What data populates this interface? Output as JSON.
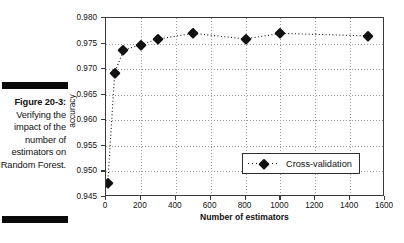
{
  "caption": {
    "label": "Figure 20-3:",
    "body": "Verifying the impact of the number of estimators on Random Forest."
  },
  "chart_data": {
    "type": "line",
    "title": "",
    "xlabel": "Number of estimators",
    "ylabel": "accuracy",
    "xlim": [
      0,
      1600
    ],
    "ylim": [
      0.945,
      0.98
    ],
    "xticks": [
      0,
      200,
      400,
      600,
      800,
      1000,
      1200,
      1400,
      1600
    ],
    "xtick_labels": [
      "0",
      "200",
      "400",
      "600",
      "800",
      "1000",
      "1200",
      "1400",
      "1600"
    ],
    "yticks": [
      0.945,
      0.95,
      0.955,
      0.96,
      0.965,
      0.97,
      0.975,
      0.98
    ],
    "ytick_labels": [
      "0.945",
      "0.950",
      "0.955",
      "0.960",
      "0.965",
      "0.970",
      "0.975",
      "0.980"
    ],
    "grid": true,
    "legend_position": "lower right",
    "series": [
      {
        "name": "Cross-validation",
        "marker": "diamond",
        "linestyle": "dotted",
        "color": "#111111",
        "x": [
          10,
          50,
          100,
          200,
          300,
          500,
          800,
          1000,
          1500
        ],
        "values": [
          0.9477,
          0.9693,
          0.9737,
          0.9748,
          0.9759,
          0.977,
          0.9759,
          0.977,
          0.9765
        ]
      }
    ]
  },
  "legend": {
    "entries": [
      {
        "label": "Cross-validation"
      }
    ]
  }
}
